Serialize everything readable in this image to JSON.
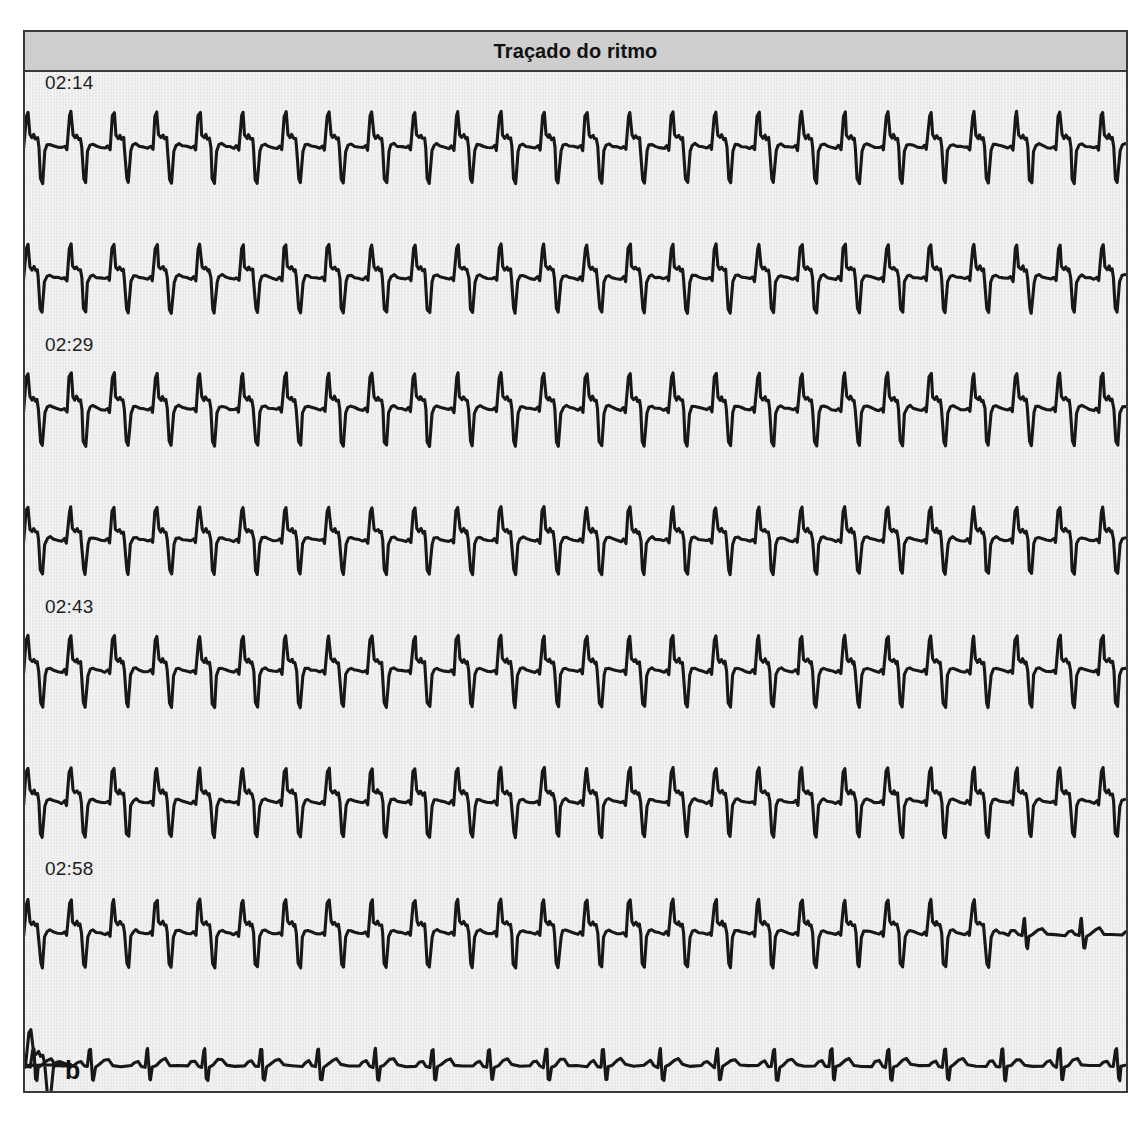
{
  "panel": {
    "title": "Traçado do ritmo",
    "letter": "b",
    "caption": ""
  },
  "colors": {
    "header_bg": "#cecece",
    "panel_bg": "#e9e9e9",
    "border": "#3a3a3a",
    "trace": "#16181a",
    "label_text": "#1d1d1d"
  },
  "chart_data": {
    "type": "line",
    "title": "Traçado do ritmo",
    "xlabel": "",
    "ylabel": "",
    "grid": false,
    "legend_position": "none",
    "series": [
      {
        "name": "02:14",
        "time_label": "02:14",
        "rhythm": "wide-complex-tachycardia",
        "beat_period_px": 43,
        "amplitude": 1.0,
        "convert_at_px": null
      },
      {
        "name": "02:29",
        "time_label": "02:29",
        "rhythm": "wide-complex-tachycardia",
        "beat_period_px": 43,
        "amplitude": 0.96,
        "convert_at_px": null
      },
      {
        "name": "02:43",
        "time_label": "02:43",
        "rhythm": "wide-complex-tachycardia",
        "beat_period_px": 43,
        "amplitude": 1.02,
        "convert_at_px": null
      },
      {
        "name": "02:58",
        "time_label": "02:58",
        "rhythm": "wide-complex-tachycardia",
        "beat_period_px": 43,
        "amplitude": 0.94,
        "convert_at_px": null
      },
      {
        "name": "03:13",
        "time_label": "03:13",
        "rhythm": "wide-complex-tachycardia",
        "beat_period_px": 43,
        "amplitude": 1.0,
        "convert_at_px": null
      },
      {
        "name": "03:27",
        "time_label": "03:27",
        "rhythm": "wide-complex-tachycardia",
        "beat_period_px": 43,
        "amplitude": 0.97,
        "convert_at_px": null
      },
      {
        "name": "03:42",
        "time_label": "03:42",
        "rhythm": "conversion",
        "beat_period_px": 43,
        "amplitude": 0.95,
        "convert_at_px": 942,
        "sinus_period_px": 57
      },
      {
        "name": "03:57",
        "time_label": "03:57",
        "rhythm": "sinus",
        "beat_period_px": 57,
        "amplitude": 1.0,
        "convert_at_px": 0
      }
    ],
    "strip_layout": {
      "count": 8,
      "spacing_px": 131,
      "first_label_y": 86,
      "first_trace_y": 103,
      "trace_height_px": 100,
      "width_px": 1101
    }
  }
}
